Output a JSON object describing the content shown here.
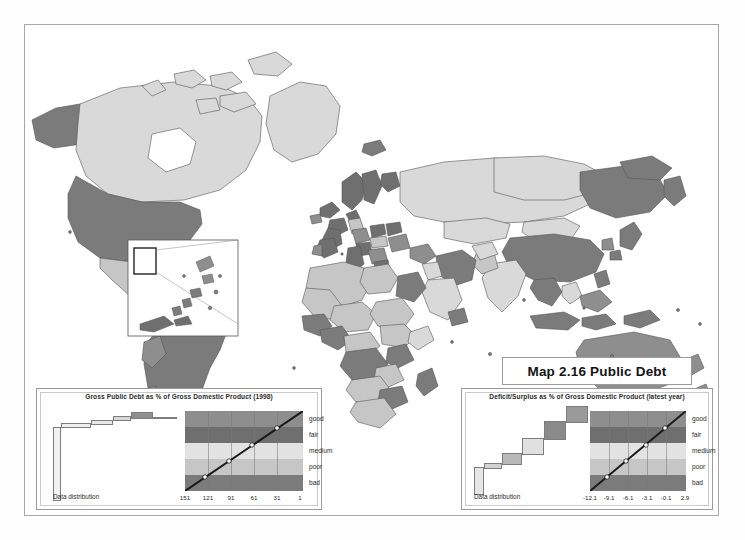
{
  "document": {
    "title": "Map 2.16 Public Debt",
    "type": "choropleth-world-map",
    "frame": true
  },
  "palette": {
    "good": "#8e8e8e",
    "fair": "#6f6f6f",
    "medium": "#e2e2e2",
    "poor": "#c6c6c6",
    "bad": "#7b7b7b",
    "no_data": "#ffffff",
    "outline": "#555555",
    "border": "#9b9b9b"
  },
  "legends": [
    {
      "id": "left",
      "title": "Gross Public Debt as % of Gross Domestic Product (1998)",
      "distribution_label": "Data distribution",
      "classes": [
        "good",
        "fair",
        "medium",
        "poor",
        "bad"
      ],
      "ticks": [
        "151",
        "121",
        "91",
        "61",
        "31",
        "1"
      ],
      "band_colors": [
        "#8e8e8e",
        "#6f6f6f",
        "#e2e2e2",
        "#c6c6c6",
        "#7b7b7b"
      ],
      "distribution_blocks": [
        {
          "x": 0,
          "y": 16,
          "w": 8,
          "h": 74,
          "fill": "#f2f2f2"
        },
        {
          "x": 8,
          "y": 12,
          "w": 30,
          "h": 5,
          "fill": "#efefef"
        },
        {
          "x": 38,
          "y": 9,
          "w": 22,
          "h": 5,
          "fill": "#e8e8e8"
        },
        {
          "x": 60,
          "y": 5,
          "w": 18,
          "h": 5,
          "fill": "#d8d8d8"
        },
        {
          "x": 78,
          "y": 1,
          "w": 22,
          "h": 7,
          "fill": "#8f8f8f"
        },
        {
          "x": 100,
          "y": 6,
          "w": 24,
          "h": 2,
          "fill": "#f4f4f4"
        }
      ]
    },
    {
      "id": "right",
      "title": "Deficit/Surplus as % of Gross Domestic Product (latest year)",
      "distribution_label": "Data distribution",
      "classes": [
        "good",
        "fair",
        "medium",
        "poor",
        "bad"
      ],
      "ticks": [
        "-12.1",
        "-9.1",
        "-6.1",
        "-3.1",
        "-0.1",
        "2.9"
      ],
      "band_colors": [
        "#8e8e8e",
        "#6f6f6f",
        "#e2e2e2",
        "#c6c6c6",
        "#7b7b7b"
      ],
      "distribution_blocks": [
        {
          "x": 0,
          "y": 62,
          "w": 10,
          "h": 28,
          "fill": "#e6e6e6"
        },
        {
          "x": 10,
          "y": 58,
          "w": 18,
          "h": 6,
          "fill": "#d2d2d2"
        },
        {
          "x": 28,
          "y": 48,
          "w": 20,
          "h": 12,
          "fill": "#b9b9b9"
        },
        {
          "x": 48,
          "y": 33,
          "w": 22,
          "h": 17,
          "fill": "#e0e0e0"
        },
        {
          "x": 70,
          "y": 16,
          "w": 22,
          "h": 19,
          "fill": "#8a8a8a"
        },
        {
          "x": 92,
          "y": 1,
          "w": 22,
          "h": 17,
          "fill": "#9a9a9a"
        }
      ]
    }
  ],
  "map": {
    "inset": {
      "present": true,
      "region": "caribbean"
    },
    "regions_note": "grayscale choropleth of world countries shaded by public debt class"
  }
}
